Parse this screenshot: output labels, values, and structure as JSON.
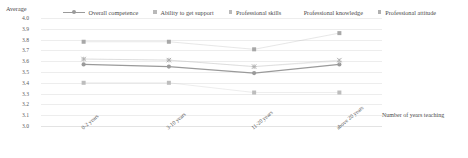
{
  "chart_data": {
    "type": "line",
    "title": "",
    "ylabel": "Average",
    "xlabel": "Number of years teaching",
    "categories": [
      "0-2 years",
      "3-10 years",
      "11-20 years",
      "above 20 years"
    ],
    "ylim": [
      3.0,
      4.0
    ],
    "yticks": [
      "4.0",
      "3.9",
      "3.8",
      "3.7",
      "3.6",
      "3.5",
      "3.4",
      "3.3",
      "3.2",
      "3.1",
      "3.0"
    ],
    "grid": true,
    "legend_position": "top",
    "series": [
      {
        "name": "Overall competence",
        "marker": "line-circle",
        "color": "#9a9a9a",
        "values": [
          3.57,
          3.55,
          3.49,
          3.57
        ]
      },
      {
        "name": "Ability to get support",
        "marker": "square",
        "color": "#bdbdbd",
        "values": [
          3.4,
          3.4,
          3.31,
          3.31
        ]
      },
      {
        "name": "Professional skills",
        "marker": "square",
        "color": "#a8a8a8",
        "values": [
          3.78,
          3.78,
          3.71,
          3.86
        ]
      },
      {
        "name": "Professional knowledge",
        "marker": "cross",
        "color": "#c4c4c4",
        "values": [
          3.62,
          3.61,
          3.55,
          3.6
        ]
      },
      {
        "name": "Professional attitude",
        "marker": "x",
        "color": "#aeaeae",
        "values": [
          3.62,
          3.61,
          3.55,
          3.61
        ]
      }
    ]
  },
  "legend": {
    "average_label": "Average",
    "items": [
      {
        "label": "Overall competence"
      },
      {
        "label": "Ability to get support"
      },
      {
        "label": "Professional skills"
      },
      {
        "label": "Professional knowledge"
      },
      {
        "label": "Professional attitude"
      }
    ]
  },
  "axes": {
    "y_title": "Average",
    "x_title": "Number of years teaching"
  }
}
